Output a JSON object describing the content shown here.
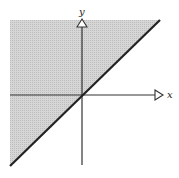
{
  "diagram": {
    "type": "half-plane inequality",
    "axes": {
      "x_label": "x",
      "y_label": "y"
    },
    "boundary_line": "y = x",
    "shaded_region": "y >= x",
    "colors": {
      "shade": "#cfcfcf",
      "line": "#222222",
      "axis": "#333333",
      "background": "#ffffff"
    }
  }
}
